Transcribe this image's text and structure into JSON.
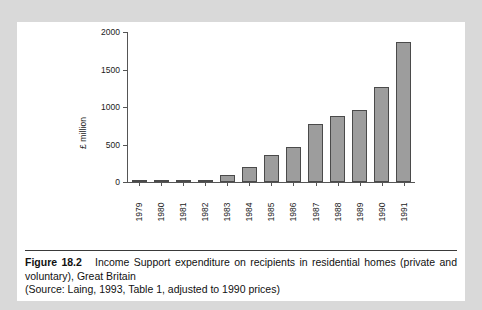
{
  "figure": {
    "label": "Figure 18.2",
    "title": "Income Support expenditure on recipients in residential homes (private and voluntary), Great Britain",
    "source": "(Source: Laing, 1993, Table 1, adjusted to 1990 prices)"
  },
  "colors": {
    "page_background": "#d9d9d9",
    "panel_background": "#ffffff",
    "bar_fill": "#9d9d9d",
    "bar_border": "#4a4a4a",
    "axis": "#555555",
    "text": "#111111"
  },
  "chart_data": {
    "type": "bar",
    "title": "",
    "xlabel": "",
    "ylabel": "£ million",
    "categories": [
      "1979",
      "1980",
      "1981",
      "1982",
      "1983",
      "1984",
      "1985",
      "1986",
      "1987",
      "1988",
      "1989",
      "1990",
      "1991"
    ],
    "values": [
      10,
      12,
      16,
      27,
      100,
      195,
      355,
      465,
      780,
      880,
      965,
      1270,
      1870
    ],
    "ylim": [
      0,
      2000
    ],
    "yticks": [
      0,
      500,
      1000,
      1500,
      2000
    ],
    "ytick_labels": [
      "0",
      "500",
      "1000",
      "1500",
      "2000"
    ],
    "grid": false,
    "legend": "none"
  }
}
